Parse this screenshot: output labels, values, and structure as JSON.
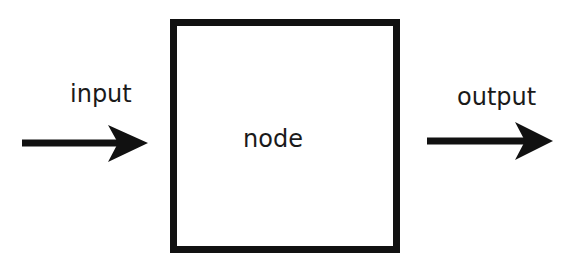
{
  "diagram": {
    "input_label": "input",
    "node_label": "node",
    "output_label": "output",
    "colors": {
      "stroke": "#111111",
      "text": "#1a1a1a",
      "background": "#ffffff"
    }
  }
}
